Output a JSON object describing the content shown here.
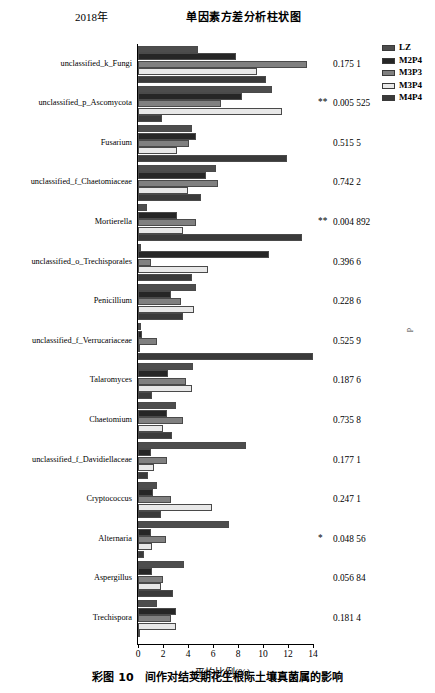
{
  "header": {
    "year": "2018年",
    "title": "单因素方差分析柱状图"
  },
  "legend": {
    "items": [
      {
        "label": "LZ",
        "color": "#4d4d4d"
      },
      {
        "label": "M2P4",
        "color": "#262626"
      },
      {
        "label": "M3P3",
        "color": "#808080"
      },
      {
        "label": "M3P4",
        "color": "#e8e8e8"
      },
      {
        "label": "M4P4",
        "color": "#3a3a3a"
      }
    ]
  },
  "axis": {
    "xlabel": "平均比例(%)",
    "ticks": [
      "0",
      "2",
      "4",
      "6",
      "8",
      "10",
      "12",
      "14"
    ],
    "xmin": 0,
    "xmax": 14
  },
  "sidemark": "p",
  "caption": "彩图 10　间作对结荚期花生根际土壤真菌属的影响",
  "chart_data": {
    "type": "bar",
    "orientation": "horizontal",
    "title": "单因素方差分析柱状图",
    "xlabel": "平均比例(%)",
    "ylabel": "",
    "xlim": [
      0,
      14
    ],
    "grid": false,
    "legend_position": "right",
    "series_names": [
      "LZ",
      "M2P4",
      "M3P3",
      "M3P4",
      "M4P4"
    ],
    "categories": [
      "unclassified_k_Fungi",
      "unclassified_p_Ascomycota",
      "Fusarium",
      "unclassified_f_Chaetomiaceae",
      "Mortierella",
      "unclassified_o_Trechisporales",
      "Penicillium",
      "unclassified_f_Verrucariaceae",
      "Talaromyces",
      "Chaetomium",
      "unclassified_f_Davidiellaceae",
      "Cryptococcus",
      "Alternaria",
      "Aspergillus",
      "Trechispora"
    ],
    "rows": [
      {
        "taxon": "unclassified_k_Fungi",
        "pvalue": "0.175 1",
        "stars": "",
        "values": [
          4.8,
          7.8,
          13.5,
          9.5,
          10.2
        ]
      },
      {
        "taxon": "unclassified_p_Ascomycota",
        "pvalue": "0.005 525",
        "stars": "**",
        "values": [
          10.7,
          8.3,
          6.6,
          11.5,
          1.9
        ]
      },
      {
        "taxon": "Fusarium",
        "pvalue": "0.515 5",
        "stars": "",
        "values": [
          4.3,
          4.6,
          4.1,
          3.1,
          11.9
        ]
      },
      {
        "taxon": "unclassified_f_Chaetomiaceae",
        "pvalue": "0.742 2",
        "stars": "",
        "values": [
          6.2,
          5.4,
          6.4,
          4.0,
          5.0
        ]
      },
      {
        "taxon": "Mortierella",
        "pvalue": "0.004 892",
        "stars": "**",
        "values": [
          0.7,
          3.1,
          4.6,
          3.6,
          13.1
        ]
      },
      {
        "taxon": "unclassified_o_Trechisporales",
        "pvalue": "0.396 6",
        "stars": "",
        "values": [
          0.2,
          10.5,
          1.0,
          5.6,
          4.3
        ]
      },
      {
        "taxon": "Penicillium",
        "pvalue": "0.228 6",
        "stars": "",
        "values": [
          4.6,
          2.6,
          3.4,
          4.5,
          3.6
        ]
      },
      {
        "taxon": "unclassified_f_Verrucariaceae",
        "pvalue": "0.525 9",
        "stars": "",
        "values": [
          0.2,
          0.3,
          1.5,
          0.1,
          14.0
        ]
      },
      {
        "taxon": "Talaromyces",
        "pvalue": "0.187 6",
        "stars": "",
        "values": [
          4.4,
          2.4,
          3.8,
          4.3,
          1.1
        ]
      },
      {
        "taxon": "Chaetomium",
        "pvalue": "0.735 8",
        "stars": "",
        "values": [
          3.0,
          2.3,
          3.6,
          2.0,
          2.7
        ]
      },
      {
        "taxon": "unclassified_f_Davidiellaceae",
        "pvalue": "0.177 1",
        "stars": "",
        "values": [
          8.6,
          1.0,
          2.3,
          1.3,
          0.8
        ]
      },
      {
        "taxon": "Cryptococcus",
        "pvalue": "0.247 1",
        "stars": "",
        "values": [
          1.5,
          1.2,
          2.6,
          5.9,
          1.8
        ]
      },
      {
        "taxon": "Alternaria",
        "pvalue": "0.048 56",
        "stars": "*",
        "values": [
          7.3,
          1.0,
          2.2,
          1.1,
          0.5
        ]
      },
      {
        "taxon": "Aspergillus",
        "pvalue": "0.056 84",
        "stars": "",
        "values": [
          3.7,
          1.1,
          2.0,
          1.8,
          2.8
        ]
      },
      {
        "taxon": "Trechispora",
        "pvalue": "0.181 4",
        "stars": "",
        "values": [
          1.5,
          3.0,
          2.6,
          3.0,
          0.05
        ]
      }
    ]
  }
}
